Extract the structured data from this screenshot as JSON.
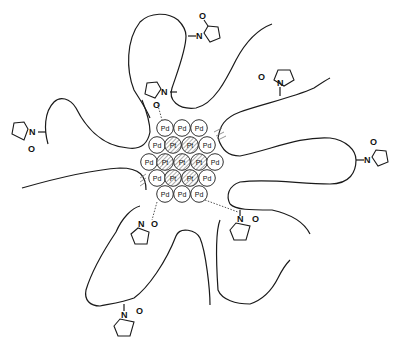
{
  "diagram": {
    "type": "nanoparticle-polymer-schematic",
    "core": {
      "rows": [
        {
          "y": 128,
          "atoms": [
            {
              "el": "Pd",
              "x": 165
            },
            {
              "el": "Pd",
              "x": 182
            },
            {
              "el": "Pd",
              "x": 199
            }
          ]
        },
        {
          "y": 145,
          "atoms": [
            {
              "el": "Pd",
              "x": 157
            },
            {
              "el": "Pt",
              "x": 173
            },
            {
              "el": "Pt",
              "x": 190
            },
            {
              "el": "Pd",
              "x": 207
            }
          ]
        },
        {
          "y": 162,
          "atoms": [
            {
              "el": "Pd",
              "x": 149
            },
            {
              "el": "Pt",
              "x": 165
            },
            {
              "el": "Pt",
              "x": 182
            },
            {
              "el": "Pt",
              "x": 199
            },
            {
              "el": "Pd",
              "x": 215
            }
          ]
        },
        {
          "y": 178,
          "atoms": [
            {
              "el": "Pd",
              "x": 157
            },
            {
              "el": "Pt",
              "x": 173
            },
            {
              "el": "Pt",
              "x": 190
            },
            {
              "el": "Pd",
              "x": 207
            }
          ]
        },
        {
          "y": 194,
          "atoms": [
            {
              "el": "Pd",
              "x": 165
            },
            {
              "el": "Pd",
              "x": 182
            },
            {
              "el": "Pd",
              "x": 199
            }
          ]
        }
      ],
      "labels": {
        "pd": "Pd",
        "pt": "Pt"
      }
    },
    "pyrrolidone_labels": {
      "n": "N",
      "o": "O"
    },
    "colors": {
      "stroke": "#1a1a1a",
      "background": "#ffffff"
    }
  }
}
